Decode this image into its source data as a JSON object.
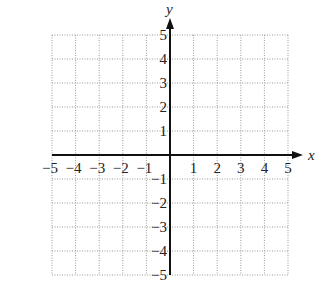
{
  "chart_data": {
    "type": "scatter",
    "title": "",
    "xlabel": "x",
    "ylabel": "y",
    "xlim": [
      -5,
      5
    ],
    "ylim": [
      -5,
      5
    ],
    "grid": true,
    "grid_style": "dotted",
    "x_ticks": [
      -5,
      -4,
      -3,
      -2,
      -1,
      1,
      2,
      3,
      4,
      5
    ],
    "y_ticks": [
      -5,
      -4,
      -3,
      -2,
      -1,
      1,
      2,
      3,
      4,
      5
    ],
    "x_tick_labels": [
      "−5",
      "−4",
      "−3",
      "−2",
      "−1",
      "1",
      "2",
      "3",
      "4",
      "5"
    ],
    "y_tick_labels": [
      "−5",
      "−4",
      "−3",
      "−2",
      "−1",
      "1",
      "2",
      "3",
      "4",
      "5"
    ],
    "series": [],
    "legend": null
  },
  "colors": {
    "axis": "#111111",
    "grid": "#9a9a9a",
    "text": "#222222"
  }
}
